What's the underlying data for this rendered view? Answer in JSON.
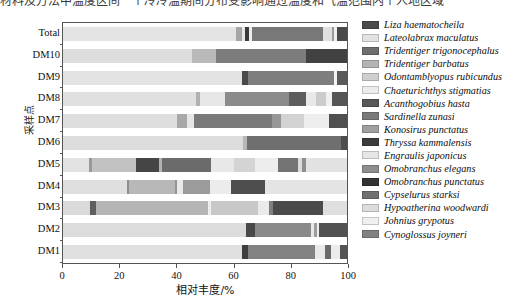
{
  "figure": {
    "top_text": "材料及方法中温度区间一个冷冷温期间分布受影响通过温度和气温范围内个人地区域"
  },
  "axes": {
    "y_axis_title": "采样点",
    "x_axis_title": "相对丰度/%",
    "x_ticks": [
      "0",
      "20",
      "40",
      "60",
      "80",
      "100"
    ],
    "y_ticks": [
      "Total",
      "DM10",
      "DM9",
      "DM8",
      "DM7",
      "DM6",
      "DM5",
      "DM4",
      "DM3",
      "DM2",
      "DM1"
    ]
  },
  "chart_data": {
    "type": "bar",
    "orientation": "horizontal",
    "stacked": true,
    "normalized_percent": true,
    "title": "",
    "xlabel": "相对丰度/%",
    "ylabel": "采样点",
    "xlim": [
      0,
      100
    ],
    "grid": false,
    "legend_position": "right",
    "categories": [
      "DM1",
      "DM2",
      "DM3",
      "DM4",
      "DM5",
      "DM6",
      "DM7",
      "DM8",
      "DM9",
      "DM10",
      "Total"
    ],
    "display_order_top_to_bottom": [
      "Total",
      "DM10",
      "DM9",
      "DM8",
      "DM7",
      "DM6",
      "DM5",
      "DM4",
      "DM3",
      "DM2",
      "DM1"
    ],
    "series": [
      {
        "name": "Liza haematocheila",
        "color": "#4a4a4a",
        "values": [
          0.0,
          0.0,
          0.0,
          0.0,
          0.0,
          0.0,
          0.0,
          0.0,
          0.0,
          0.0,
          0.0
        ]
      },
      {
        "name": "Lateolabrax maculatus",
        "color": "#e2e2e2",
        "values": [
          64.0,
          10.0,
          5.5,
          26.5,
          13.0,
          2.0,
          6.5,
          22.0,
          58.0,
          17.5,
          22.5
        ]
      },
      {
        "name": "Tridentiger trigonocephalus",
        "color": "#6e6e6e",
        "values": [
          0.0,
          0.0,
          2.5,
          0.0,
          1.5,
          0.0,
          0.0,
          0.0,
          0.0,
          0.0,
          0.0
        ]
      },
      {
        "name": "Tridentiger barbatus",
        "color": "#b4b4b4",
        "values": [
          0.0,
          56.0,
          36.0,
          25.5,
          20.0,
          56.0,
          36.0,
          22.0,
          9.5,
          38.5,
          41.5
        ]
      },
      {
        "name": "Odontamblyopus rubicundus",
        "color": "#cfcfcf",
        "values": [
          0.0,
          0.0,
          18.5,
          0.0,
          10.0,
          6.5,
          11.5,
          7.0,
          0.0,
          0.0,
          0.0
        ]
      },
      {
        "name": "Chaeturichthys stigmatias",
        "color": "#ececec",
        "values": [
          0.0,
          0.0,
          0.0,
          10.5,
          0.0,
          10.0,
          0.0,
          0.0,
          0.0,
          0.0,
          0.0
        ]
      },
      {
        "name": "Acanthogobius hasta",
        "color": "#585858",
        "values": [
          2.5,
          5.0,
          2.0,
          0.0,
          10.0,
          0.0,
          1.5,
          0.0,
          1.5,
          0.0,
          0.5
        ]
      },
      {
        "name": "Sardinella zunasi",
        "color": "#7a7a7a",
        "values": [
          20.0,
          16.0,
          12.0,
          9.0,
          14.5,
          19.0,
          24.5,
          28.0,
          22.0,
          21.0,
          19.5
        ]
      },
      {
        "name": "Konosirus punctatus",
        "color": "#a0a0a0",
        "values": [
          0.0,
          0.0,
          0.0,
          0.0,
          0.0,
          0.0,
          0.0,
          4.0,
          0.0,
          0.0,
          0.0
        ]
      },
      {
        "name": "Thryssa kammalensis",
        "color": "#3c3c3c",
        "values": [
          0.0,
          0.0,
          0.0,
          6.5,
          6.0,
          0.0,
          2.0,
          0.0,
          0.0,
          3.0,
          2.5
        ]
      },
      {
        "name": "Engraulis japonicus",
        "color": "#e6e6e6",
        "values": [
          6.5,
          4.0,
          9.5,
          9.0,
          8.0,
          2.0,
          4.5,
          6.0,
          4.5,
          8.0,
          4.5
        ]
      },
      {
        "name": "Omobranchus elegans",
        "color": "#8e8e8e",
        "values": [
          1.5,
          1.5,
          2.0,
          3.0,
          5.0,
          1.5,
          3.0,
          3.0,
          1.0,
          2.0,
          2.0
        ]
      },
      {
        "name": "Omobranchus punctatus",
        "color": "#333333",
        "values": [
          2.0,
          5.0,
          4.0,
          2.5,
          4.0,
          1.0,
          4.5,
          2.5,
          1.5,
          6.0,
          3.5
        ]
      },
      {
        "name": "Cypselurus starksi",
        "color": "#707070",
        "values": [
          1.0,
          1.0,
          4.0,
          3.5,
          3.5,
          1.0,
          3.0,
          2.5,
          1.0,
          2.0,
          2.0
        ]
      },
      {
        "name": "Hypoatherina woodwardi",
        "color": "#dcdcdc",
        "values": [
          1.0,
          0.5,
          2.0,
          2.0,
          2.5,
          0.5,
          1.5,
          1.5,
          0.5,
          1.0,
          1.0
        ]
      },
      {
        "name": "Johnius grypotus",
        "color": "#f0f0f0",
        "values": [
          0.5,
          0.5,
          1.0,
          1.0,
          1.0,
          0.5,
          1.0,
          0.5,
          0.5,
          0.5,
          0.5
        ]
      },
      {
        "name": "Cynoglossus joyneri",
        "color": "#828282",
        "values": [
          1.0,
          0.5,
          1.0,
          1.0,
          1.0,
          0.0,
          0.5,
          1.0,
          0.0,
          0.5,
          0.5
        ]
      }
    ],
    "legend_entries": [
      {
        "label": "Liza haematocheila",
        "color": "#4a4a4a"
      },
      {
        "label": "Lateolabrax maculatus",
        "color": "#e2e2e2"
      },
      {
        "label": "Tridentiger trigonocephalus",
        "color": "#6e6e6e"
      },
      {
        "label": "Tridentiger barbatus",
        "color": "#b4b4b4"
      },
      {
        "label": "Odontamblyopus rubicundus",
        "color": "#cfcfcf"
      },
      {
        "label": "Chaeturichthys stigmatias",
        "color": "#ececec"
      },
      {
        "label": "Acanthogobius hasta",
        "color": "#585858"
      },
      {
        "label": "Sardinella zunasi",
        "color": "#7a7a7a"
      },
      {
        "label": "Konosirus punctatus",
        "color": "#a0a0a0"
      },
      {
        "label": "Thryssa kammalensis",
        "color": "#3c3c3c"
      },
      {
        "label": "Engraulis japonicus",
        "color": "#e6e6e6"
      },
      {
        "label": "Omobranchus elegans",
        "color": "#8e8e8e"
      },
      {
        "label": "Omobranchus punctatus",
        "color": "#333333"
      },
      {
        "label": "Cypselurus starksi",
        "color": "#707070"
      },
      {
        "label": "Hypoatherina woodwardi",
        "color": "#dcdcdc"
      },
      {
        "label": "Johnius grypotus",
        "color": "#f0f0f0"
      },
      {
        "label": "Cynoglossus joyneri",
        "color": "#828282"
      }
    ],
    "bars": [
      {
        "label": "Total",
        "segments": [
          {
            "color": "#e4e4e4",
            "pct": 61.0
          },
          {
            "color": "#a6a6a6",
            "pct": 2.2
          },
          {
            "color": "#e8e8e8",
            "pct": 0.9
          },
          {
            "color": "#3b3b3b",
            "pct": 1.5
          },
          {
            "color": "#ededed",
            "pct": 1.0
          },
          {
            "color": "#787878",
            "pct": 25.0
          },
          {
            "color": "#e0e0e0",
            "pct": 3.0
          },
          {
            "color": "#9a9a9a",
            "pct": 0.8
          },
          {
            "color": "#efefef",
            "pct": 1.0
          },
          {
            "color": "#4a4a4a",
            "pct": 3.6
          }
        ]
      },
      {
        "label": "DM10",
        "segments": [
          {
            "color": "#dddddd",
            "pct": 45.5
          },
          {
            "color": "#b9b9b9",
            "pct": 8.5
          },
          {
            "color": "#7c7c7c",
            "pct": 31.5
          },
          {
            "color": "#414141",
            "pct": 14.5
          }
        ]
      },
      {
        "label": "DM9",
        "segments": [
          {
            "color": "#e3e3e3",
            "pct": 63.0
          },
          {
            "color": "#494949",
            "pct": 2.3
          },
          {
            "color": "#7e7e7e",
            "pct": 30.0
          },
          {
            "color": "#f2f2f2",
            "pct": 1.2
          },
          {
            "color": "#5a5a5a",
            "pct": 3.5
          }
        ]
      },
      {
        "label": "DM8",
        "segments": [
          {
            "color": "#e0e0e0",
            "pct": 47.0
          },
          {
            "color": "#b0b0b0",
            "pct": 1.2
          },
          {
            "color": "#e6e6e6",
            "pct": 9.0
          },
          {
            "color": "#8b8b8b",
            "pct": 22.5
          },
          {
            "color": "#5d5d5d",
            "pct": 6.0
          },
          {
            "color": "#e9e9e9",
            "pct": 3.5
          },
          {
            "color": "#cccccc",
            "pct": 3.5
          },
          {
            "color": "#f0f0f0",
            "pct": 2.0
          },
          {
            "color": "#555555",
            "pct": 5.3
          }
        ]
      },
      {
        "label": "DM7",
        "segments": [
          {
            "color": "#dedede",
            "pct": 40.0
          },
          {
            "color": "#a8a8a8",
            "pct": 3.5
          },
          {
            "color": "#e6e6e6",
            "pct": 2.5
          },
          {
            "color": "#7a7a7a",
            "pct": 27.5
          },
          {
            "color": "#979797",
            "pct": 3.2
          },
          {
            "color": "#d2d2d2",
            "pct": 8.0
          },
          {
            "color": "#eeeeee",
            "pct": 9.0
          },
          {
            "color": "#505050",
            "pct": 6.3
          }
        ]
      },
      {
        "label": "DM6",
        "segments": [
          {
            "color": "#dcdcdc",
            "pct": 63.5
          },
          {
            "color": "#b6b6b6",
            "pct": 1.3
          },
          {
            "color": "#6f6f6f",
            "pct": 33.0
          },
          {
            "color": "#4d4d4d",
            "pct": 2.2
          }
        ]
      },
      {
        "label": "DM5",
        "segments": [
          {
            "color": "#e3e3e3",
            "pct": 9.0
          },
          {
            "color": "#989898",
            "pct": 1.2
          },
          {
            "color": "#c2c2c2",
            "pct": 15.5
          },
          {
            "color": "#454545",
            "pct": 8.0
          },
          {
            "color": "#b2b2b2",
            "pct": 1.0
          },
          {
            "color": "#6b6b6b",
            "pct": 17.5
          },
          {
            "color": "#e8e8e8",
            "pct": 8.0
          },
          {
            "color": "#d4d4d4",
            "pct": 7.5
          },
          {
            "color": "#ededed",
            "pct": 8.0
          },
          {
            "color": "#737373",
            "pct": 7.0
          },
          {
            "color": "#dcdcdc",
            "pct": 1.5
          },
          {
            "color": "#8e8e8e",
            "pct": 1.3
          },
          {
            "color": "#e2e2e2",
            "pct": 14.5
          }
        ]
      },
      {
        "label": "DM4",
        "segments": [
          {
            "color": "#dfdfdf",
            "pct": 22.5
          },
          {
            "color": "#8d8d8d",
            "pct": 0.8
          },
          {
            "color": "#b8b8b8",
            "pct": 16.0
          },
          {
            "color": "#949494",
            "pct": 0.8
          },
          {
            "color": "#e9e9e9",
            "pct": 2.0
          },
          {
            "color": "#9b9b9b",
            "pct": 9.5
          },
          {
            "color": "#ececec",
            "pct": 7.5
          },
          {
            "color": "#4e4e4e",
            "pct": 12.0
          },
          {
            "color": "#e4e4e4",
            "pct": 28.9
          }
        ]
      },
      {
        "label": "DM3",
        "segments": [
          {
            "color": "#dadada",
            "pct": 9.5
          },
          {
            "color": "#5f5f5f",
            "pct": 2.2
          },
          {
            "color": "#b5b5b5",
            "pct": 39.5
          },
          {
            "color": "#eeeeee",
            "pct": 1.0
          },
          {
            "color": "#c8c8c8",
            "pct": 16.5
          },
          {
            "color": "#eaeaea",
            "pct": 4.0
          },
          {
            "color": "#7f7f7f",
            "pct": 1.2
          },
          {
            "color": "#4a4a4a",
            "pct": 17.5
          },
          {
            "color": "#dfdfdf",
            "pct": 8.6
          }
        ]
      },
      {
        "label": "DM2",
        "segments": [
          {
            "color": "#dcdcdc",
            "pct": 64.5
          },
          {
            "color": "#494949",
            "pct": 3.2
          },
          {
            "color": "#8a8a8a",
            "pct": 19.5
          },
          {
            "color": "#e8e8e8",
            "pct": 1.2
          },
          {
            "color": "#9d9d9d",
            "pct": 1.0
          },
          {
            "color": "#eeeeee",
            "pct": 0.8
          },
          {
            "color": "#525252",
            "pct": 9.8
          }
        ]
      },
      {
        "label": "DM1",
        "segments": [
          {
            "color": "#e0e0e0",
            "pct": 63.0
          },
          {
            "color": "#3f3f3f",
            "pct": 2.3
          },
          {
            "color": "#828282",
            "pct": 23.5
          },
          {
            "color": "#e9e9e9",
            "pct": 3.5
          },
          {
            "color": "#6a6a6a",
            "pct": 2.0
          },
          {
            "color": "#ececec",
            "pct": 3.2
          },
          {
            "color": "#555555",
            "pct": 2.5
          }
        ]
      }
    ]
  }
}
